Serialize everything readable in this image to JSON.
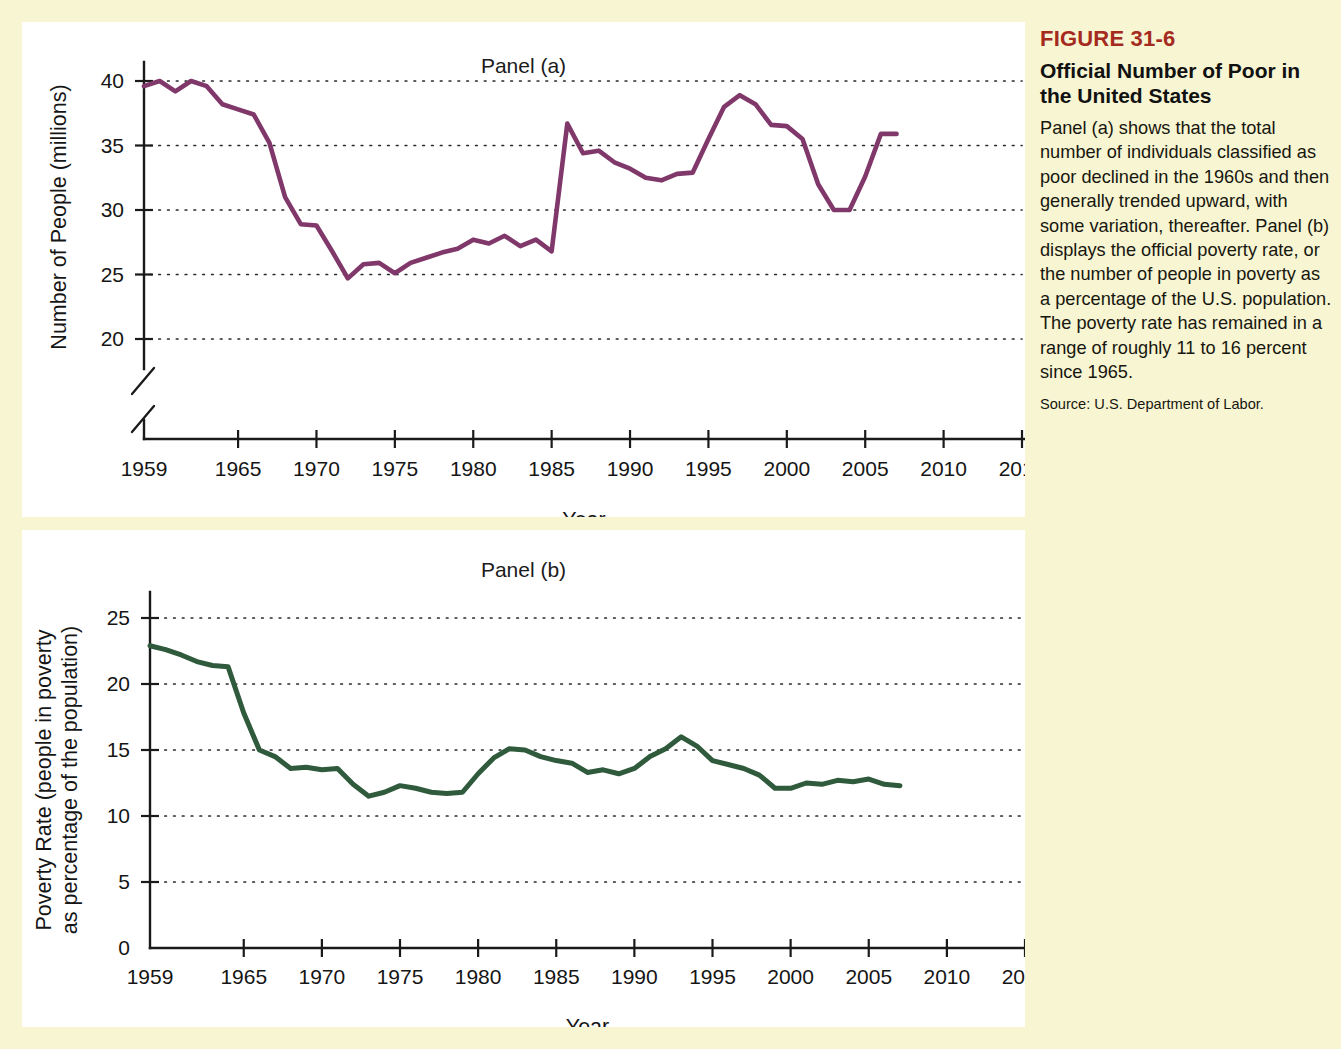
{
  "figure": {
    "number": "FIGURE 31-6",
    "title": "Official Number of Poor in the United States",
    "body": "Panel (a) shows that the total number of individuals classified as poor declined in the 1960s and then generally trended upward, with some variation, thereafter. Panel (b) displays the official poverty rate, or the number of people in poverty as a percentage of the U.S. population. The poverty rate has remained in a range of roughly 11 to 16 percent since 1965.",
    "source": "Source: U.S. Department of Labor.",
    "accent_color": "#a52a1e",
    "background_color": "#f7f5d2",
    "panel_background_color": "#ffffff"
  },
  "chart_data": [
    {
      "type": "line",
      "panel": "Panel (a)",
      "title": "Panel (a)",
      "xlabel": "Year",
      "ylabel": "Number of People (millions)",
      "series_color": "#80386a",
      "grid": true,
      "legend": "none",
      "xlim": [
        1959,
        2016
      ],
      "ylim": [
        18,
        42
      ],
      "y_axis_break": true,
      "xticks": [
        1959,
        1965,
        1970,
        1975,
        1980,
        1985,
        1990,
        1995,
        2000,
        2005,
        2010,
        2015
      ],
      "xticklabels": [
        "1959",
        "1965",
        "1970",
        "1975",
        "1980",
        "1985",
        "1990",
        "1995",
        "2000",
        "2005",
        "2010",
        "2015"
      ],
      "yticks": [
        20,
        25,
        30,
        35,
        40
      ],
      "yticklabels": [
        "20",
        "25",
        "30",
        "35",
        "40"
      ],
      "x": [
        1959,
        1960,
        1961,
        1962,
        1963,
        1964,
        1965,
        1966,
        1967,
        1968,
        1969,
        1970,
        1971,
        1972,
        1973,
        1974,
        1975,
        1976,
        1977,
        1978,
        1979,
        1980,
        1981,
        1982,
        1983,
        1984,
        1985,
        1986,
        1987,
        1988,
        1989,
        1990,
        1991,
        1992,
        1993,
        1994,
        1995,
        1996,
        1997,
        1998,
        1999,
        2000,
        2001,
        2002,
        2003,
        2004,
        2005,
        2006,
        2007
      ],
      "values": [
        39.5,
        39.9,
        39.6,
        38.6,
        36.4,
        36.1,
        33.2,
        28.5,
        27.8,
        25.4,
        24.1,
        25.4,
        25.6,
        24.5,
        23.0,
        23.4,
        25.9,
        25.0,
        24.7,
        24.5,
        26.1,
        29.3,
        31.8,
        34.4,
        35.3,
        33.7,
        33.1,
        32.4,
        32.2,
        31.7,
        31.5,
        33.6,
        35.7,
        38.0,
        39.3,
        38.1,
        36.4,
        36.5,
        35.6,
        34.5,
        32.3,
        31.6,
        32.9,
        34.6,
        35.9,
        37.0,
        37.0,
        36.5,
        37.3
      ],
      "line_points": [
        [
          1959,
          39.5
        ],
        [
          1960,
          39.9
        ],
        [
          1961,
          39.6
        ],
        [
          1962,
          38.6
        ],
        [
          1963,
          36.4
        ],
        [
          1964,
          36.1
        ],
        [
          1965,
          33.2
        ],
        [
          1966,
          28.5
        ],
        [
          1967,
          27.8
        ],
        [
          1968,
          25.4
        ],
        [
          1969,
          24.1
        ],
        [
          1970,
          25.4
        ],
        [
          1971,
          25.6
        ],
        [
          1972,
          24.5
        ],
        [
          1973,
          23.0
        ],
        [
          1974,
          23.4
        ],
        [
          1975,
          25.9
        ],
        [
          1976,
          25.0
        ],
        [
          1977,
          24.7
        ],
        [
          1978,
          24.5
        ],
        [
          1979,
          26.1
        ],
        [
          1980,
          29.3
        ],
        [
          1981,
          31.8
        ],
        [
          1982,
          34.4
        ],
        [
          1983,
          35.3
        ],
        [
          1984,
          33.7
        ],
        [
          1985,
          33.1
        ],
        [
          1986,
          32.4
        ],
        [
          1987,
          32.2
        ],
        [
          1988,
          31.7
        ],
        [
          1989,
          31.5
        ],
        [
          1990,
          33.6
        ],
        [
          1991,
          35.7
        ],
        [
          1992,
          38.0
        ],
        [
          1993,
          39.3
        ],
        [
          1994,
          38.1
        ],
        [
          1995,
          36.4
        ],
        [
          1996,
          36.5
        ],
        [
          1997,
          35.6
        ],
        [
          1998,
          34.5
        ],
        [
          1999,
          32.3
        ],
        [
          2000,
          31.6
        ],
        [
          2001,
          32.9
        ],
        [
          2002,
          34.6
        ],
        [
          2003,
          35.9
        ],
        [
          2004,
          37.0
        ],
        [
          2005,
          37.0
        ],
        [
          2006,
          36.5
        ],
        [
          2007,
          37.3
        ]
      ],
      "plot_y": [
        39.6,
        40.0,
        39.2,
        40.0,
        39.6,
        38.2,
        37.8,
        37.4,
        35.2,
        31.0,
        28.9,
        28.8,
        26.8,
        24.7,
        25.8,
        25.9,
        25.1,
        25.9,
        26.3,
        26.7,
        27.0,
        27.7,
        27.4,
        28.0,
        27.2,
        27.7,
        26.8,
        36.7,
        34.4,
        34.6,
        33.7,
        33.2,
        32.5,
        32.3,
        32.8,
        32.9,
        35.5,
        38.0,
        38.9,
        38.2,
        36.6,
        36.5,
        35.5,
        32.0,
        30.0,
        30.0,
        32.6,
        35.9,
        35.9,
        35.7,
        35.4
      ],
      "plot_x": [
        1959,
        1960,
        1961,
        1962,
        1963,
        1964,
        1965,
        1966,
        1967,
        1968,
        1969,
        1970,
        1971,
        1972,
        1973,
        1974,
        1975,
        1976,
        1977,
        1978,
        1979,
        1980,
        1981,
        1982,
        1983,
        1984,
        1985,
        1986,
        1987,
        1988,
        1989,
        1990,
        1991,
        1992,
        1993,
        1994,
        1995,
        1996,
        1997,
        1998,
        1999,
        2000,
        2001,
        2002,
        2003,
        2004,
        2005,
        2006,
        2007
      ]
    },
    {
      "type": "line",
      "panel": "Panel (b)",
      "title": "Panel (b)",
      "xlabel": "Year",
      "ylabel": "Poverty Rate (people in poverty as percentage of the population)",
      "series_color": "#2f5a3c",
      "grid": true,
      "legend": "none",
      "xlim": [
        1959,
        2016
      ],
      "ylim": [
        0,
        26
      ],
      "y_axis_break": false,
      "xticks": [
        1959,
        1965,
        1970,
        1975,
        1980,
        1985,
        1990,
        1995,
        2000,
        2005,
        2010,
        2015
      ],
      "xticklabels": [
        "1959",
        "1965",
        "1970",
        "1975",
        "1980",
        "1985",
        "1990",
        "1995",
        "2000",
        "2005",
        "2010",
        "2015"
      ],
      "yticks": [
        0,
        5,
        10,
        15,
        20,
        25
      ],
      "yticklabels": [
        "0",
        "5",
        "10",
        "15",
        "20",
        "25"
      ],
      "x": [
        1959,
        1960,
        1961,
        1962,
        1963,
        1964,
        1965,
        1966,
        1967,
        1968,
        1969,
        1970,
        1971,
        1972,
        1973,
        1974,
        1975,
        1976,
        1977,
        1978,
        1979,
        1980,
        1981,
        1982,
        1983,
        1984,
        1985,
        1986,
        1987,
        1988,
        1989,
        1990,
        1991,
        1992,
        1993,
        1994,
        1995,
        1996,
        1997,
        1998,
        1999,
        2000,
        2001,
        2002,
        2003,
        2004,
        2005,
        2006,
        2007
      ],
      "values": [
        22.9,
        22.6,
        22.2,
        21.7,
        21.4,
        21.3,
        17.8,
        15.0,
        14.5,
        13.6,
        13.7,
        13.5,
        13.6,
        12.4,
        11.5,
        11.8,
        12.3,
        12.1,
        11.8,
        11.7,
        11.8,
        13.2,
        14.4,
        15.1,
        15.0,
        14.5,
        14.2,
        14.0,
        13.3,
        13.5,
        13.2,
        13.6,
        14.5,
        15.1,
        16.0,
        15.3,
        14.2,
        13.9,
        13.6,
        13.1,
        12.1,
        12.1,
        12.5,
        12.4,
        12.7,
        12.6,
        12.8,
        12.4,
        12.3
      ]
    }
  ]
}
